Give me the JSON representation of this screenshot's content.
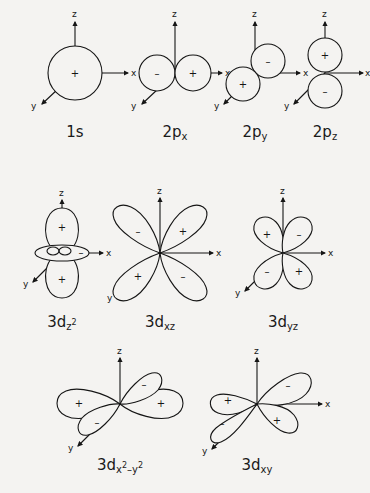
{
  "figure": {
    "background_color": "#f4f3f1",
    "ink_color": "#151515",
    "axis_labels": {
      "x": "x",
      "y": "y",
      "z": "z"
    },
    "signs": {
      "positive": "+",
      "negative": "–"
    },
    "rows": [
      {
        "name": "row-1",
        "orbitals": [
          "1s",
          "2px",
          "2py",
          "2pz"
        ]
      },
      {
        "name": "row-2",
        "orbitals": [
          "3dz2",
          "3dxz",
          "3dyz"
        ]
      },
      {
        "name": "row-3",
        "orbitals": [
          "3dx2y2",
          "3dxy"
        ]
      }
    ]
  },
  "orbitals": [
    {
      "id": "1s",
      "label_base": "1s",
      "label_sub": "",
      "label_sup": "",
      "label_plain": "1s",
      "shape": "sphere",
      "lobes": [
        {
          "sign": "+",
          "position": "center"
        }
      ],
      "axes": [
        "z",
        "x",
        "y"
      ]
    },
    {
      "id": "2px",
      "label_base": "2p",
      "label_sub": "x",
      "label_sup": "",
      "label_plain": "2px",
      "shape": "two-spheres-horizontal",
      "lobes": [
        {
          "sign": "–",
          "position": "left"
        },
        {
          "sign": "+",
          "position": "right"
        }
      ],
      "axes": [
        "z",
        "x",
        "y"
      ]
    },
    {
      "id": "2py",
      "label_base": "2p",
      "label_sub": "y",
      "label_sup": "",
      "label_plain": "2py",
      "shape": "two-spheres-diagonal",
      "lobes": [
        {
          "sign": "+",
          "position": "lower-left"
        },
        {
          "sign": "–",
          "position": "upper-right"
        }
      ],
      "axes": [
        "z",
        "x",
        "y"
      ]
    },
    {
      "id": "2pz",
      "label_base": "2p",
      "label_sub": "z",
      "label_sup": "",
      "label_plain": "2pz",
      "shape": "two-spheres-vertical",
      "lobes": [
        {
          "sign": "+",
          "position": "top"
        },
        {
          "sign": "–",
          "position": "bottom"
        }
      ],
      "axes": [
        "z",
        "x",
        "y"
      ]
    },
    {
      "id": "3dz2",
      "label_base": "3d",
      "label_sub": "z",
      "label_sup": "2",
      "label_plain": "3dz2",
      "shape": "dumbbell-with-torus",
      "lobes": [
        {
          "sign": "+",
          "position": "top"
        },
        {
          "sign": "+",
          "position": "bottom"
        },
        {
          "sign": "–",
          "position": "torus"
        }
      ],
      "axes": [
        "z",
        "x",
        "y"
      ]
    },
    {
      "id": "3dxz",
      "label_base": "3d",
      "label_sub": "xz",
      "label_sup": "",
      "label_plain": "3dxz",
      "shape": "four-lobe-cloverleaf",
      "lobes": [
        {
          "sign": "–",
          "position": "upper-left"
        },
        {
          "sign": "+",
          "position": "upper-right"
        },
        {
          "sign": "+",
          "position": "lower-left"
        },
        {
          "sign": "–",
          "position": "lower-right"
        }
      ],
      "axes": [
        "z",
        "x",
        "y"
      ]
    },
    {
      "id": "3dyz",
      "label_base": "3d",
      "label_sub": "yz",
      "label_sup": "",
      "label_plain": "3dyz",
      "shape": "four-lobe-cloverleaf",
      "lobes": [
        {
          "sign": "+",
          "position": "upper-left"
        },
        {
          "sign": "–",
          "position": "upper-right"
        },
        {
          "sign": "–",
          "position": "lower-left"
        },
        {
          "sign": "+",
          "position": "lower-right"
        }
      ],
      "axes": [
        "z",
        "x",
        "y"
      ]
    },
    {
      "id": "3dx2y2",
      "label_base": "3d",
      "label_sub_parts": [
        {
          "text": "x",
          "type": "sub"
        },
        {
          "text": "2",
          "type": "sup"
        },
        {
          "text": "–",
          "type": "sub"
        },
        {
          "text": "y",
          "type": "sub"
        },
        {
          "text": "2",
          "type": "sup"
        }
      ],
      "label_plain": "3dx2-y2",
      "shape": "four-lobe-cloverleaf",
      "lobes": [
        {
          "sign": "+",
          "position": "left"
        },
        {
          "sign": "+",
          "position": "right"
        },
        {
          "sign": "–",
          "position": "top-back"
        },
        {
          "sign": "–",
          "position": "bottom-front"
        }
      ],
      "axes": [
        "z",
        "x",
        "y"
      ]
    },
    {
      "id": "3dxy",
      "label_base": "3d",
      "label_sub": "xy",
      "label_sup": "",
      "label_plain": "3dxy",
      "shape": "four-lobe-cloverleaf",
      "lobes": [
        {
          "sign": "+",
          "position": "upper-left"
        },
        {
          "sign": "–",
          "position": "upper-right"
        },
        {
          "sign": "–",
          "position": "lower-left"
        },
        {
          "sign": "+",
          "position": "lower-right"
        }
      ],
      "axes": [
        "z",
        "x",
        "y"
      ]
    }
  ]
}
